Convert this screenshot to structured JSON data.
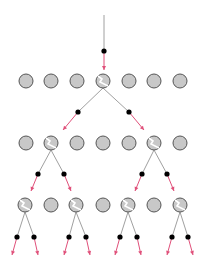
{
  "colors": {
    "background": "#ffffff",
    "nucleus_fill": "#c8c8c8",
    "nucleus_stroke": "#555555",
    "crack": "#ffffff",
    "path_line": "#a0a0a0",
    "neutron": "#000000",
    "arrow": "#e0507a"
  },
  "nucleus_radius": 7,
  "incoming": {
    "x1": 104,
    "y1": 15,
    "dot": [
      104,
      51
    ],
    "x2": 104,
    "y2": 70
  },
  "rows": [
    {
      "y": 81,
      "nuclei": [
        {
          "x": 26,
          "split": false
        },
        {
          "x": 51,
          "split": false
        },
        {
          "x": 77,
          "split": false
        },
        {
          "x": 103,
          "split": true
        },
        {
          "x": 129,
          "split": false
        },
        {
          "x": 154,
          "split": false
        },
        {
          "x": 180,
          "split": false
        }
      ]
    },
    {
      "y": 143,
      "nuclei": [
        {
          "x": 26,
          "split": false
        },
        {
          "x": 51,
          "split": true
        },
        {
          "x": 77,
          "split": false
        },
        {
          "x": 103,
          "split": false
        },
        {
          "x": 129,
          "split": false
        },
        {
          "x": 154,
          "split": true
        },
        {
          "x": 180,
          "split": false
        }
      ]
    },
    {
      "y": 205,
      "nuclei": [
        {
          "x": 25,
          "split": true
        },
        {
          "x": 51,
          "split": false
        },
        {
          "x": 76,
          "split": true
        },
        {
          "x": 103,
          "split": false
        },
        {
          "x": 128,
          "split": true
        },
        {
          "x": 154,
          "split": false
        },
        {
          "x": 180,
          "split": true
        }
      ]
    }
  ],
  "neutrons": [
    {
      "from": [
        103,
        88
      ],
      "dot": [
        78,
        112
      ],
      "to": [
        63,
        130
      ]
    },
    {
      "from": [
        103,
        88
      ],
      "dot": [
        129,
        112
      ],
      "to": [
        144,
        130
      ]
    },
    {
      "from": [
        51,
        150
      ],
      "dot": [
        38,
        174
      ],
      "to": [
        31,
        191
      ]
    },
    {
      "from": [
        51,
        150
      ],
      "dot": [
        64,
        174
      ],
      "to": [
        71,
        191
      ]
    },
    {
      "from": [
        154,
        150
      ],
      "dot": [
        142,
        174
      ],
      "to": [
        135,
        191
      ]
    },
    {
      "from": [
        154,
        150
      ],
      "dot": [
        167,
        174
      ],
      "to": [
        174,
        191
      ]
    },
    {
      "from": [
        25,
        212
      ],
      "dot": [
        17,
        237
      ],
      "to": [
        12,
        255
      ]
    },
    {
      "from": [
        25,
        212
      ],
      "dot": [
        34,
        237
      ],
      "to": [
        38,
        255
      ]
    },
    {
      "from": [
        76,
        212
      ],
      "dot": [
        69,
        237
      ],
      "to": [
        64,
        255
      ]
    },
    {
      "from": [
        76,
        212
      ],
      "dot": [
        86,
        237
      ],
      "to": [
        90,
        255
      ]
    },
    {
      "from": [
        128,
        212
      ],
      "dot": [
        120,
        237
      ],
      "to": [
        115,
        255
      ]
    },
    {
      "from": [
        128,
        212
      ],
      "dot": [
        137,
        237
      ],
      "to": [
        141,
        255
      ]
    },
    {
      "from": [
        180,
        212
      ],
      "dot": [
        172,
        237
      ],
      "to": [
        167,
        255
      ]
    },
    {
      "from": [
        180,
        212
      ],
      "dot": [
        188,
        237
      ],
      "to": [
        193,
        255
      ]
    }
  ]
}
